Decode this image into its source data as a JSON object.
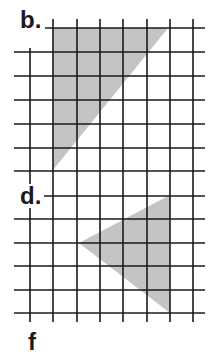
{
  "figure": {
    "background": "#ffffff",
    "grid_color": "#1a1a1a",
    "shade_color": "#c4c4c4",
    "panels": [
      {
        "label": "b.",
        "label_pos": [
          20,
          8
        ],
        "shape": "right-triangle",
        "vertices": [
          [
            53,
            28
          ],
          [
            168,
            28
          ],
          [
            53,
            170
          ]
        ]
      },
      {
        "label": "d.",
        "label_pos": [
          20,
          184
        ],
        "shape": "triangle",
        "vertices": [
          [
            170,
            195
          ],
          [
            79,
            243
          ],
          [
            170,
            313
          ]
        ]
      }
    ],
    "partial_label": "f",
    "partial_label_pos": [
      28,
      330
    ],
    "grid": {
      "verticals": [
        30,
        53,
        77,
        100,
        123,
        147,
        170,
        193
      ],
      "horizontals": [
        28,
        52,
        76,
        100,
        124,
        148,
        171,
        196,
        219,
        243,
        266,
        290,
        313
      ],
      "x_start": 14,
      "x_end": 205,
      "y_start": 28,
      "y_end": 322
    }
  }
}
